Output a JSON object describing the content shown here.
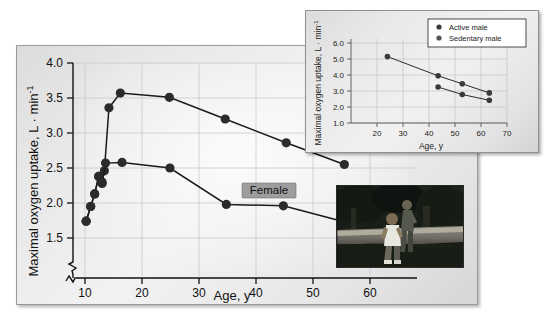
{
  "figure": {
    "title_visible": false,
    "photo": {
      "alt_name": "photo-two-runners-jogging-outdoors",
      "caption": ""
    }
  },
  "main_chart": {
    "ylabel": "Maximal oxygen uptake, L · min",
    "ylabel_exponent": "-1",
    "xlabel": "Age, y",
    "y_ticks": [
      "1.5",
      "2.0",
      "2.5",
      "3.0",
      "3.5",
      "4.0"
    ],
    "x_ticks": [
      "10",
      "20",
      "30",
      "40",
      "50",
      "60"
    ],
    "series_labels": {
      "male": "Male",
      "female": "Female"
    }
  },
  "inset_chart": {
    "ylabel": "Maximal oxygen uptake, L · min",
    "ylabel_exponent": "-1",
    "xlabel": "Age, y",
    "y_ticks": [
      "1.0",
      "2.0",
      "3.0",
      "4.0",
      "5.0",
      "6.0"
    ],
    "x_ticks": [
      "20",
      "30",
      "40",
      "50",
      "60",
      "70"
    ],
    "legend": [
      {
        "label": "Active male",
        "color": "#3a3a3a"
      },
      {
        "label": "Sedentary male",
        "color": "#555555"
      }
    ]
  },
  "chart_data": [
    {
      "id": "main",
      "type": "line",
      "title": "",
      "xlabel": "Age, y",
      "ylabel": "Maximal oxygen uptake, L · min-1",
      "xlim": [
        8,
        60
      ],
      "ylim": [
        1.35,
        4.0
      ],
      "x_ticks": [
        10,
        20,
        30,
        40,
        50,
        60
      ],
      "y_ticks": [
        1.5,
        2.0,
        2.5,
        3.0,
        3.5,
        4.0
      ],
      "grid": true,
      "axis_break_y": true,
      "legend_position": "inline-labels",
      "series": [
        {
          "name": "Male",
          "x": [
            10.2,
            11.0,
            11.7,
            12.4,
            13.0,
            13.4,
            14.2,
            16.2,
            24.8,
            34.6,
            45.3,
            55.5
          ],
          "y": [
            1.74,
            1.95,
            2.13,
            2.38,
            2.3,
            2.46,
            3.36,
            3.57,
            3.51,
            3.2,
            2.86,
            2.55
          ]
        },
        {
          "name": "Female",
          "x": [
            10.2,
            11.0,
            11.7,
            12.4,
            13.0,
            13.6,
            16.5,
            24.9,
            34.8,
            44.8,
            55.6
          ],
          "y": [
            1.74,
            1.95,
            2.13,
            2.38,
            2.28,
            2.57,
            2.58,
            2.5,
            1.98,
            1.96,
            1.73
          ]
        }
      ]
    },
    {
      "id": "inset",
      "type": "line",
      "title": "",
      "xlabel": "Age, y",
      "ylabel": "Maximal oxygen uptake, L · min-1",
      "xlim": [
        15,
        72
      ],
      "ylim": [
        0.6,
        6.6
      ],
      "x_ticks": [
        20,
        30,
        40,
        50,
        60,
        70
      ],
      "y_ticks": [
        1.0,
        2.0,
        3.0,
        4.0,
        5.0,
        6.0
      ],
      "grid": true,
      "legend_position": "top-right",
      "series": [
        {
          "name": "Active male",
          "x": [
            24,
            43.5,
            52.8,
            63.2
          ],
          "y": [
            5.15,
            3.95,
            3.45,
            2.88
          ]
        },
        {
          "name": "Sedentary male",
          "x": [
            43.5,
            52.8,
            63.2
          ],
          "y": [
            3.25,
            2.78,
            2.42
          ]
        }
      ]
    }
  ]
}
